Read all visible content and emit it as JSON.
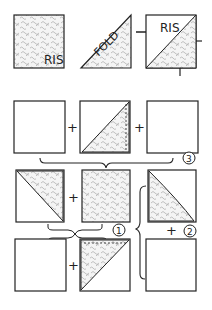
{
  "labels": {
    "ris_1": "RIS",
    "fold": "FOLD",
    "ris_2": "RIS",
    "plus": "+",
    "step_1": "1",
    "step_2": "2",
    "step_3": "3"
  },
  "colors": {
    "stroke": "#222222",
    "fabric": "#e6e6e6",
    "background": "#ffffff"
  }
}
